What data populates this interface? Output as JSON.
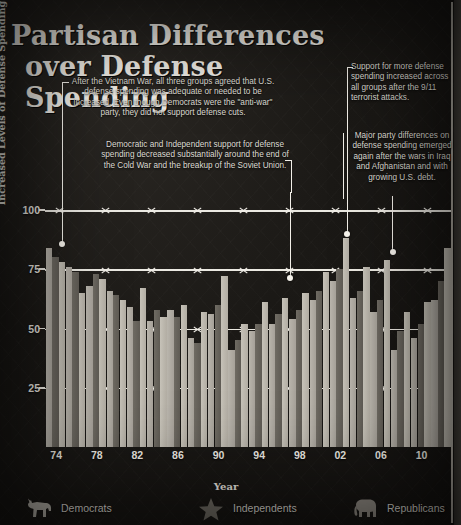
{
  "title": {
    "line1": "Partisan Differences",
    "line2": "over Defense Spending"
  },
  "annotations": [
    {
      "id": "post-vietnam",
      "text": "After the Vietnam War, all three groups agreed that U.S. defense spending was adequate or needed to be increased. Even though Democrats were the \"anti-war\" party, they did not support defense cuts."
    },
    {
      "id": "cold-war-end",
      "text": "Democratic and Independent support for defense spending decreased substantially around the end of the Cold War and the breakup of the Soviet Union."
    },
    {
      "id": "post-911",
      "text": "Support for more defense spending increased across all groups after the 9/11 terrorist attacks."
    },
    {
      "id": "iraq-afghanistan",
      "text": "Major party differences on defense spending emerged again after the wars in Iraq and Afghanistan and with growing U.S. debt."
    }
  ],
  "legend": [
    {
      "label": "Democrats",
      "icon": "donkey-icon",
      "color": "#b9b5ac"
    },
    {
      "label": "Independents",
      "icon": "star-icon",
      "color": "#6f6b63"
    },
    {
      "label": "Republicans",
      "icon": "elephant-icon",
      "color": "#c6c2b8"
    }
  ],
  "chart_data": {
    "type": "bar",
    "title": "Partisan Differences over Defense Spending",
    "xlabel": "Year",
    "ylabel": "% of Respondents Who Support Existing or Increased Levels of Defense Spending",
    "ylim": [
      0,
      100
    ],
    "yticks": [
      25,
      50,
      75,
      100
    ],
    "grid": true,
    "legend_position": "bottom",
    "categories": [
      "74",
      "76",
      "78",
      "80",
      "82",
      "84",
      "86",
      "88",
      "90",
      "92",
      "94",
      "96",
      "98",
      "00",
      "02",
      "04",
      "06",
      "08",
      "10",
      "12"
    ],
    "tick_labels": [
      "74",
      "78",
      "82",
      "86",
      "90",
      "94",
      "98",
      "02",
      "06",
      "10"
    ],
    "series": [
      {
        "name": "Democrats",
        "color": "#b9b5ac",
        "values": [
          84,
          76,
          68,
          66,
          59,
          53,
          58,
          46,
          56,
          41,
          49,
          52,
          54,
          62,
          70,
          63,
          57,
          41,
          46,
          62
        ]
      },
      {
        "name": "Independents",
        "color": "#6f6b63",
        "values": [
          80,
          74,
          73,
          64,
          53,
          58,
          55,
          44,
          60,
          45,
          52,
          56,
          58,
          66,
          75,
          66,
          62,
          49,
          52,
          70
        ]
      },
      {
        "name": "Republicans",
        "color": "#c6c2b8",
        "values": [
          78,
          65,
          71,
          62,
          67,
          55,
          60,
          57,
          72,
          52,
          61,
          63,
          65,
          74,
          88,
          76,
          79,
          57,
          61,
          84
        ]
      }
    ]
  }
}
